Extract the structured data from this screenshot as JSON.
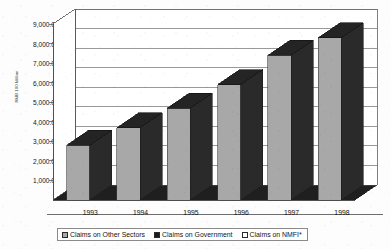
{
  "chart_data": {
    "type": "bar",
    "title": "",
    "subtitle": "",
    "xlabel": "",
    "ylabel": "RMB 100 Million",
    "categories": [
      "1993",
      "1994",
      "1995",
      "1996",
      "1997",
      "1998"
    ],
    "ylim": [
      0,
      9000
    ],
    "ytick_values": [
      1000,
      2000,
      3000,
      4000,
      5000,
      6000,
      7000,
      8000,
      9000
    ],
    "ytick_labels": [
      "1,000.0",
      "2,000.0",
      "3,000.0",
      "4,000.0",
      "5,000.0",
      "6,000.0",
      "7,000.0",
      "8,000.0",
      "9,000.0"
    ],
    "grid": true,
    "grid_axis": "y",
    "three_d": true,
    "legend_position": "bottom",
    "series": [
      {
        "name": "Claims on Other Sectors",
        "color": "#a8a8a8",
        "values": [
          2800,
          3700,
          4700,
          5900,
          7400,
          8300
        ]
      },
      {
        "name": "Claims on Government",
        "color": "#1c1c1c",
        "values": [
          0,
          0,
          0,
          0,
          0,
          0
        ]
      },
      {
        "name": "Claims on NMFI*",
        "color": "#ffffff",
        "values": [
          0,
          0,
          0,
          0,
          0,
          0
        ]
      }
    ],
    "annotations": []
  },
  "legend": {
    "items": [
      {
        "label": "Claims on Other Sectors",
        "swatch": "#a8a8a8"
      },
      {
        "label": "Claims on Government",
        "swatch": "#1c1c1c"
      },
      {
        "label": "Claims on NMFI*",
        "swatch": "#ffffff"
      }
    ]
  },
  "colors": {
    "bar_front": "#a8a8a8",
    "bar_side": "#2a2a2a",
    "bar_top": "#242424",
    "floor": "#1f1f1f",
    "gridline": "#6e6e6e",
    "axis": "#4a4a4a",
    "background": "#fdfdfd"
  }
}
